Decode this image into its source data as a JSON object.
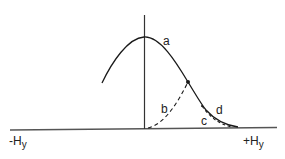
{
  "diagram": {
    "type": "curve-diagram",
    "colors": {
      "background": "#ffffff",
      "stroke": "#1a1a1a",
      "axis": "#555555",
      "text": "#222222"
    },
    "axis": {
      "left_label": "-H",
      "left_sub": "y",
      "right_label": "+H",
      "right_sub": "y"
    },
    "curves": [
      {
        "id": "a",
        "label": "a",
        "style": "solid",
        "description": "bell-shaped curve peaking at vertical axis"
      },
      {
        "id": "b",
        "label": "b",
        "style": "dashed",
        "description": "dashed curve rising from origin to marked point on curve a"
      },
      {
        "id": "c",
        "label": "c",
        "style": "dashed",
        "description": "dashed curve descending below tail of curve a"
      },
      {
        "id": "d",
        "label": "d",
        "style": "solid",
        "description": "tail segment of curve a"
      }
    ],
    "marked_point": {
      "on_curve": "a"
    }
  }
}
